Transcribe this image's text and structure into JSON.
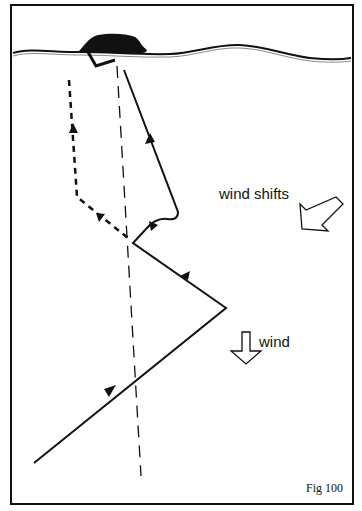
{
  "figure": {
    "caption": "Fig 100",
    "labels": {
      "wind_shifts": "wind shifts",
      "wind": "wind"
    }
  },
  "diagram": {
    "type": "sailing-course-wind-shift",
    "elements": [
      {
        "id": "shoreline",
        "kind": "wavy line with island/headland at top"
      },
      {
        "id": "mark",
        "kind": "L-shaped mark / buoy near shore"
      },
      {
        "id": "rhumb-line",
        "kind": "thin dashed straight line from bottom to mark"
      },
      {
        "id": "sailed-course",
        "kind": "solid zig-zag course with direction arrows"
      },
      {
        "id": "alternative-course",
        "kind": "thick dashed course on left with direction arrows"
      },
      {
        "id": "wind-arrow",
        "kind": "hollow arrow pointing down",
        "label": "wind"
      },
      {
        "id": "wind-shift-arrow",
        "kind": "hollow arrow pointing down-left",
        "label": "wind shifts"
      }
    ]
  },
  "colors": {
    "ink": "#111111",
    "background": "#ffffff"
  }
}
